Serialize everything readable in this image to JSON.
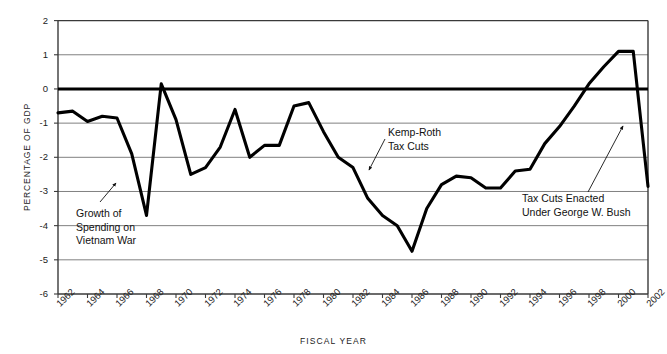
{
  "chart_data": {
    "type": "line",
    "title": "",
    "xlabel": "FISCAL YEAR",
    "ylabel": "PERCENTAGE OF GDP",
    "ylim": [
      -6,
      2
    ],
    "xlim": [
      1962,
      2002
    ],
    "yticks": [
      2,
      1,
      0,
      -1,
      -2,
      -3,
      -4,
      -5,
      -6
    ],
    "ytick_labels": [
      "2",
      "1",
      "0",
      "-1",
      "-2",
      "-3",
      "-4",
      "-5",
      "-6"
    ],
    "xticks": [
      1962,
      1964,
      1966,
      1968,
      1970,
      1972,
      1974,
      1976,
      1978,
      1980,
      1982,
      1984,
      1986,
      1988,
      1990,
      1992,
      1994,
      1996,
      1998,
      2000,
      2002
    ],
    "xtick_labels": [
      "1962",
      "1964",
      "1966",
      "1968",
      "1970",
      "1972",
      "1974",
      "1976",
      "1978",
      "1980",
      "1982",
      "1984",
      "1986",
      "1988",
      "1990",
      "1992",
      "1994",
      "1996",
      "1998",
      "2000",
      "2002"
    ],
    "grid": true,
    "legend": "none",
    "zero_line": true,
    "series": [
      {
        "name": "Federal surplus/deficit as percentage of GDP",
        "x": [
          1962,
          1963,
          1964,
          1965,
          1966,
          1967,
          1968,
          1969,
          1970,
          1971,
          1972,
          1973,
          1974,
          1975,
          1976,
          1977,
          1978,
          1979,
          1980,
          1981,
          1982,
          1983,
          1984,
          1985,
          1986,
          1987,
          1988,
          1989,
          1990,
          1991,
          1992,
          1993,
          1994,
          1995,
          1996,
          1997,
          1998,
          1999,
          2000,
          2001,
          2002
        ],
        "values": [
          -0.7,
          -0.65,
          -0.95,
          -0.8,
          -0.85,
          -1.9,
          -3.7,
          0.15,
          -0.9,
          -2.5,
          -2.3,
          -1.7,
          -0.6,
          -2.0,
          -1.65,
          -1.65,
          -0.5,
          -0.4,
          -1.25,
          -2.0,
          -2.3,
          -3.2,
          -3.7,
          -4.0,
          -4.75,
          -3.5,
          -2.8,
          -2.55,
          -2.6,
          -2.9,
          -2.9,
          -2.4,
          -2.35,
          -1.6,
          -1.1,
          -0.5,
          0.15,
          0.65,
          1.1,
          1.1,
          -2.85
        ]
      }
    ],
    "annotations": [
      {
        "id": "vietnam",
        "text": "Growth of\nSpending on\nVietnam War",
        "points_to_year": 1966,
        "points_to_value": -2.0
      },
      {
        "id": "kemp-roth",
        "text": "Kemp-Roth\nTax Cuts",
        "points_to_year": 1982,
        "points_to_value": -2.35
      },
      {
        "id": "bush",
        "text": "Tax Cuts Enacted\nUnder George W. Bush",
        "points_to_year": 2001,
        "points_to_value": -1.05
      }
    ]
  },
  "axis": {
    "y_title": "PERCENTAGE OF GDP",
    "x_title": "FISCAL YEAR"
  },
  "annotations": {
    "vietnam": "Growth of\nSpending on\nVietnam War",
    "kemproth": "Kemp-Roth\nTax Cuts",
    "bush": "Tax Cuts Enacted\nUnder George W. Bush"
  },
  "colors": {
    "line": "#000000",
    "grid": "#808080",
    "axis": "#3a3a3a",
    "zero_line": "#000000",
    "text": "#1a1a1a",
    "background": "#ffffff"
  }
}
